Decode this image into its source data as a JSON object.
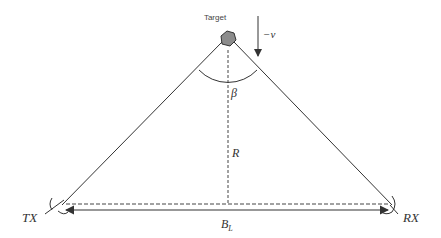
{
  "diagram": {
    "labels": {
      "target": "Target",
      "velocity": "−v",
      "beta": "β",
      "range": "R",
      "baseline": "B",
      "baseline_sub": "L",
      "tx": "TX",
      "rx": "RX"
    },
    "colors": {
      "line": "#333333",
      "target_fill": "#8c8c8c",
      "background": "#ffffff"
    }
  }
}
